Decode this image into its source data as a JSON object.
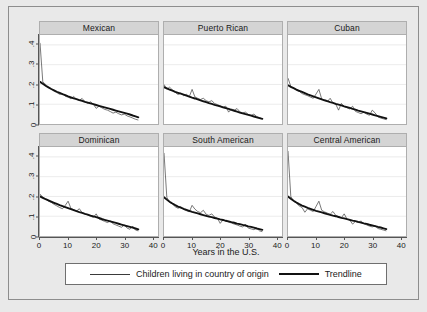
{
  "chart_data": {
    "type": "line",
    "title": "",
    "xlabel": "Years in the U.S.",
    "ylabel": "",
    "xlim": [
      0,
      42
    ],
    "ylim": [
      0,
      0.45
    ],
    "xticks": [
      0,
      10,
      20,
      30,
      40
    ],
    "xticklabels": [
      "0",
      "10",
      "20",
      "30",
      "40"
    ],
    "yticks": [
      0,
      0.1,
      0.2,
      0.3,
      0.4
    ],
    "yticklabels": [
      "0",
      ".1",
      ".2",
      ".3",
      ".4"
    ],
    "grid": true,
    "legend_position": "bottom",
    "legend": [
      {
        "label": "Children living in country of origin",
        "style": "thin"
      },
      {
        "label": "Trendline",
        "style": "thick"
      }
    ],
    "panels": [
      {
        "title": "Mexican",
        "x": [
          0,
          1,
          2,
          3,
          4,
          5,
          6,
          7,
          8,
          9,
          10,
          11,
          12,
          13,
          14,
          15,
          16,
          17,
          18,
          19,
          20,
          21,
          22,
          23,
          24,
          25,
          26,
          27,
          28,
          29,
          30,
          31,
          32,
          33,
          34,
          35
        ],
        "series_raw": [
          0.41,
          0.213,
          0.2,
          0.186,
          0.178,
          0.166,
          0.159,
          0.15,
          0.154,
          0.14,
          0.136,
          0.128,
          0.139,
          0.125,
          0.12,
          0.129,
          0.112,
          0.105,
          0.112,
          0.1,
          0.079,
          0.09,
          0.082,
          0.074,
          0.07,
          0.063,
          0.055,
          0.06,
          0.052,
          0.046,
          0.05,
          0.041,
          0.036,
          0.03,
          0.024,
          0.02
        ],
        "series_trend": [
          0.213,
          0.203,
          0.193,
          0.185,
          0.177,
          0.17,
          0.163,
          0.157,
          0.151,
          0.146,
          0.14,
          0.135,
          0.13,
          0.126,
          0.121,
          0.117,
          0.112,
          0.108,
          0.104,
          0.1,
          0.096,
          0.092,
          0.088,
          0.084,
          0.08,
          0.076,
          0.072,
          0.068,
          0.064,
          0.06,
          0.056,
          0.052,
          0.048,
          0.043,
          0.039,
          0.034
        ]
      },
      {
        "title": "Puerto Rican",
        "x": [
          0,
          1,
          2,
          3,
          4,
          5,
          6,
          7,
          8,
          9,
          10,
          11,
          12,
          13,
          14,
          15,
          16,
          17,
          18,
          19,
          20,
          21,
          22,
          23,
          24,
          25,
          26,
          27,
          28,
          29,
          30,
          31,
          32,
          33,
          34,
          35
        ],
        "series_raw": [
          0.2,
          0.176,
          0.186,
          0.172,
          0.16,
          0.149,
          0.156,
          0.143,
          0.15,
          0.138,
          0.175,
          0.137,
          0.13,
          0.124,
          0.13,
          0.118,
          0.112,
          0.118,
          0.104,
          0.098,
          0.092,
          0.086,
          0.09,
          0.06,
          0.076,
          0.07,
          0.078,
          0.062,
          0.056,
          0.06,
          0.048,
          0.044,
          0.05,
          0.038,
          0.032,
          0.026
        ],
        "series_trend": [
          0.186,
          0.18,
          0.174,
          0.169,
          0.163,
          0.158,
          0.153,
          0.148,
          0.143,
          0.138,
          0.133,
          0.129,
          0.124,
          0.12,
          0.115,
          0.111,
          0.106,
          0.102,
          0.097,
          0.093,
          0.089,
          0.084,
          0.08,
          0.076,
          0.071,
          0.067,
          0.063,
          0.058,
          0.054,
          0.05,
          0.046,
          0.042,
          0.038,
          0.034,
          0.03,
          0.026
        ]
      },
      {
        "title": "Cuban",
        "x": [
          0,
          1,
          2,
          3,
          4,
          5,
          6,
          7,
          8,
          9,
          10,
          11,
          12,
          13,
          14,
          15,
          16,
          17,
          18,
          19,
          20,
          21,
          22,
          23,
          24,
          25,
          26,
          27,
          28,
          29,
          30,
          31,
          32,
          33,
          34,
          35
        ],
        "series_raw": [
          0.232,
          0.19,
          0.182,
          0.17,
          0.165,
          0.154,
          0.148,
          0.143,
          0.136,
          0.13,
          0.152,
          0.175,
          0.126,
          0.12,
          0.113,
          0.13,
          0.106,
          0.1,
          0.07,
          0.104,
          0.088,
          0.082,
          0.076,
          0.09,
          0.064,
          0.058,
          0.052,
          0.06,
          0.05,
          0.044,
          0.07,
          0.056,
          0.036,
          0.03,
          0.026,
          0.022
        ],
        "series_trend": [
          0.196,
          0.188,
          0.181,
          0.174,
          0.168,
          0.162,
          0.156,
          0.15,
          0.145,
          0.14,
          0.135,
          0.13,
          0.125,
          0.12,
          0.116,
          0.111,
          0.107,
          0.102,
          0.098,
          0.094,
          0.089,
          0.085,
          0.081,
          0.077,
          0.073,
          0.068,
          0.064,
          0.06,
          0.056,
          0.052,
          0.048,
          0.044,
          0.04,
          0.036,
          0.032,
          0.028
        ]
      },
      {
        "title": "Dominican",
        "x": [
          0,
          1,
          2,
          3,
          4,
          5,
          6,
          7,
          8,
          9,
          10,
          11,
          12,
          13,
          14,
          15,
          16,
          17,
          18,
          19,
          20,
          21,
          22,
          23,
          24,
          25,
          26,
          27,
          28,
          29,
          30,
          31,
          32,
          33,
          34,
          35
        ],
        "series_raw": [
          0.212,
          0.196,
          0.188,
          0.176,
          0.17,
          0.16,
          0.152,
          0.144,
          0.138,
          0.155,
          0.176,
          0.14,
          0.133,
          0.126,
          0.138,
          0.118,
          0.112,
          0.106,
          0.1,
          0.094,
          0.112,
          0.086,
          0.08,
          0.074,
          0.068,
          0.076,
          0.062,
          0.056,
          0.05,
          0.044,
          0.056,
          0.04,
          0.034,
          0.05,
          0.03,
          0.026
        ],
        "series_trend": [
          0.2,
          0.193,
          0.186,
          0.18,
          0.174,
          0.168,
          0.162,
          0.156,
          0.151,
          0.146,
          0.141,
          0.136,
          0.131,
          0.126,
          0.121,
          0.117,
          0.112,
          0.108,
          0.103,
          0.099,
          0.095,
          0.091,
          0.086,
          0.082,
          0.078,
          0.074,
          0.07,
          0.066,
          0.062,
          0.058,
          0.054,
          0.05,
          0.046,
          0.042,
          0.038,
          0.034
        ]
      },
      {
        "title": "South American",
        "x": [
          0,
          1,
          2,
          3,
          4,
          5,
          6,
          7,
          8,
          9,
          10,
          11,
          12,
          13,
          14,
          15,
          16,
          17,
          18,
          19,
          20,
          21,
          22,
          23,
          24,
          25,
          26,
          27,
          28,
          29,
          30,
          31,
          32,
          33,
          34,
          35
        ],
        "series_raw": [
          0.42,
          0.196,
          0.17,
          0.162,
          0.148,
          0.14,
          0.148,
          0.134,
          0.128,
          0.122,
          0.155,
          0.136,
          0.124,
          0.118,
          0.13,
          0.11,
          0.104,
          0.112,
          0.096,
          0.09,
          0.064,
          0.082,
          0.076,
          0.07,
          0.066,
          0.06,
          0.056,
          0.05,
          0.046,
          0.058,
          0.04,
          0.036,
          0.032,
          0.04,
          0.026,
          0.022
        ],
        "series_trend": [
          0.196,
          0.184,
          0.173,
          0.164,
          0.156,
          0.149,
          0.143,
          0.137,
          0.132,
          0.127,
          0.122,
          0.118,
          0.114,
          0.11,
          0.106,
          0.102,
          0.098,
          0.095,
          0.091,
          0.088,
          0.084,
          0.081,
          0.077,
          0.074,
          0.07,
          0.067,
          0.063,
          0.06,
          0.056,
          0.053,
          0.049,
          0.046,
          0.042,
          0.038,
          0.035,
          0.031
        ]
      },
      {
        "title": "Central American",
        "x": [
          0,
          1,
          2,
          3,
          4,
          5,
          6,
          7,
          8,
          9,
          10,
          11,
          12,
          13,
          14,
          15,
          16,
          17,
          18,
          19,
          20,
          21,
          22,
          23,
          24,
          25,
          26,
          27,
          28,
          29,
          30,
          31,
          32,
          33,
          34,
          35
        ],
        "series_raw": [
          0.43,
          0.2,
          0.176,
          0.166,
          0.152,
          0.144,
          0.12,
          0.138,
          0.13,
          0.124,
          0.15,
          0.176,
          0.13,
          0.122,
          0.116,
          0.11,
          0.124,
          0.104,
          0.098,
          0.092,
          0.112,
          0.086,
          0.08,
          0.06,
          0.074,
          0.068,
          0.076,
          0.062,
          0.056,
          0.05,
          0.046,
          0.052,
          0.038,
          0.034,
          0.03,
          0.026
        ],
        "series_trend": [
          0.2,
          0.188,
          0.178,
          0.169,
          0.161,
          0.154,
          0.148,
          0.142,
          0.137,
          0.132,
          0.127,
          0.123,
          0.119,
          0.115,
          0.111,
          0.107,
          0.103,
          0.1,
          0.096,
          0.092,
          0.089,
          0.085,
          0.082,
          0.078,
          0.075,
          0.071,
          0.068,
          0.064,
          0.061,
          0.057,
          0.054,
          0.05,
          0.046,
          0.043,
          0.039,
          0.035
        ]
      }
    ]
  }
}
